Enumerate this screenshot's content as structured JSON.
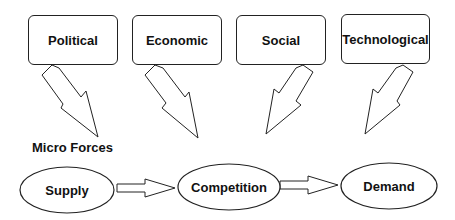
{
  "diagram": {
    "macro_forces": [
      {
        "label": "Political"
      },
      {
        "label": "Economic"
      },
      {
        "label": "Social"
      },
      {
        "label": "Technological"
      }
    ],
    "micro_forces": {
      "title": "Micro Forces",
      "nodes": [
        {
          "label": "Supply"
        },
        {
          "label": "Competition"
        },
        {
          "label": "Demand"
        }
      ]
    },
    "edges": [
      {
        "from": "Political",
        "to": "Micro Forces"
      },
      {
        "from": "Economic",
        "to": "Micro Forces"
      },
      {
        "from": "Social",
        "to": "Micro Forces"
      },
      {
        "from": "Technological",
        "to": "Micro Forces"
      },
      {
        "from": "Supply",
        "to": "Competition"
      },
      {
        "from": "Competition",
        "to": "Demand"
      }
    ],
    "colors": {
      "stroke": "#222222",
      "fill": "#ffffff",
      "text": "#111111"
    }
  }
}
